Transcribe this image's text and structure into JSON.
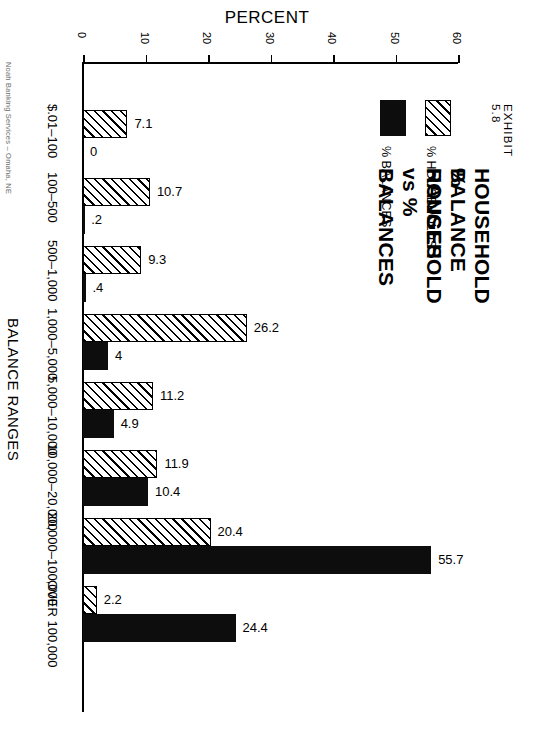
{
  "exhibit_number": "EXHIBIT 5.8",
  "title_line_1": "HOUSEHOLD BALANCE RANGES",
  "title_line_2": "% HOUSEHOLD vs % BALANCES",
  "credit": "Noah Banking Services – Omaha, NE",
  "legend": [
    {
      "name": "balances",
      "label": "% BALANCES",
      "swatch": "solid-black-swatch"
    },
    {
      "name": "households",
      "label": "% HOUSEHOLDS",
      "swatch": "hatched-swatch"
    }
  ],
  "chart_data": {
    "type": "bar",
    "orientation": "horizontal",
    "xlabel": "PERCENT",
    "ylabel": "BALANCE RANGES",
    "xlim": [
      0,
      60
    ],
    "xticks": [
      0,
      10,
      20,
      30,
      40,
      50,
      60
    ],
    "xtick_labels": [
      "0",
      "10",
      "20",
      "30",
      "40",
      "50",
      "60"
    ],
    "grid": false,
    "legend_position": "right",
    "categories": [
      "$.01–100",
      "100–500",
      "500–1,000",
      "1,000–5,000",
      "5,000–10,000",
      "10,000–20,000",
      "20,000–100,000",
      "OVER 100,000"
    ],
    "series": [
      {
        "name": "% HOUSEHOLDS",
        "style": "hatched",
        "values": [
          7.1,
          10.7,
          9.3,
          26.2,
          11.2,
          11.9,
          20.4,
          2.2
        ],
        "labels": [
          "7.1",
          "10.7",
          "9.3",
          "26.2",
          "11.2",
          "11.9",
          "20.4",
          "2.2"
        ]
      },
      {
        "name": "% BALANCES",
        "style": "solid",
        "values": [
          0,
          0.2,
          0.4,
          4,
          4.9,
          10.4,
          55.7,
          24.4
        ],
        "labels": [
          "0",
          ".2",
          ".4",
          "4",
          "4.9",
          "10.4",
          "55.7",
          "24.4"
        ]
      }
    ]
  }
}
